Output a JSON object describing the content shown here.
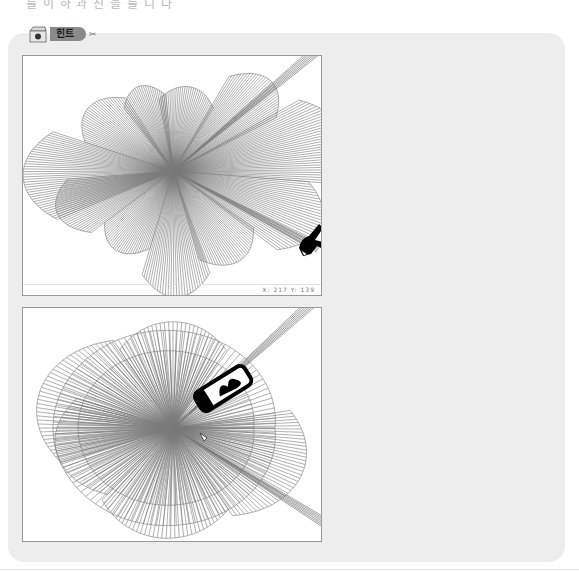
{
  "heading_fragment": "를 이 하 과 진 을 를 니 다",
  "hint": {
    "label": "힌트",
    "icon": "box-icon",
    "scissors": "✂"
  },
  "panels": [
    {
      "name": "top-drawing",
      "status_text": "X: 217  Y: 139",
      "center": [
        150,
        115
      ],
      "fans": [
        {
          "start": 160,
          "end": 205,
          "r": 150,
          "n": 40
        },
        {
          "start": 120,
          "end": 160,
          "r": 110,
          "n": 30
        },
        {
          "start": 95,
          "end": 125,
          "r": 100,
          "n": 24
        },
        {
          "start": 60,
          "end": 100,
          "r": 95,
          "n": 30
        },
        {
          "start": 30,
          "end": 62,
          "r": 140,
          "n": 30
        },
        {
          "start": -5,
          "end": 32,
          "r": 175,
          "n": 34
        },
        {
          "start": -40,
          "end": -5,
          "r": 160,
          "n": 30
        },
        {
          "start": -75,
          "end": -38,
          "r": 120,
          "n": 30
        },
        {
          "start": -105,
          "end": -72,
          "r": 140,
          "n": 28
        },
        {
          "start": -140,
          "end": -105,
          "r": 105,
          "n": 28
        },
        {
          "start": -175,
          "end": -140,
          "r": 125,
          "n": 30
        }
      ],
      "long_rays": [
        [
          40,
          230
        ],
        [
          -28,
          165
        ]
      ],
      "cursor": "hand-pointer-icon",
      "cursor_pos": [
        278,
        178
      ]
    },
    {
      "name": "bottom-drawing",
      "status_text": "",
      "center": [
        150,
        120
      ],
      "fans": [
        {
          "start": 0,
          "end": 360,
          "r": 120,
          "n": 110
        },
        {
          "start": 0,
          "end": 360,
          "r": 95,
          "n": 90
        },
        {
          "start": 120,
          "end": 200,
          "r": 140,
          "n": 40
        },
        {
          "start": 60,
          "end": 120,
          "r": 125,
          "n": 30
        },
        {
          "start": -60,
          "end": 10,
          "r": 140,
          "n": 40
        },
        {
          "start": -130,
          "end": -60,
          "r": 130,
          "n": 36
        },
        {
          "start": -200,
          "end": -130,
          "r": 120,
          "n": 36
        }
      ],
      "long_rays": [
        [
          42,
          230
        ],
        [
          -32,
          200
        ]
      ],
      "cursor": "eraser-tool-icon",
      "cursor_pos": [
        175,
        95
      ]
    }
  ],
  "colors": {
    "box_bg": "#ededed",
    "line": "#7a7a7a",
    "panel_border": "#9a9a9a"
  }
}
